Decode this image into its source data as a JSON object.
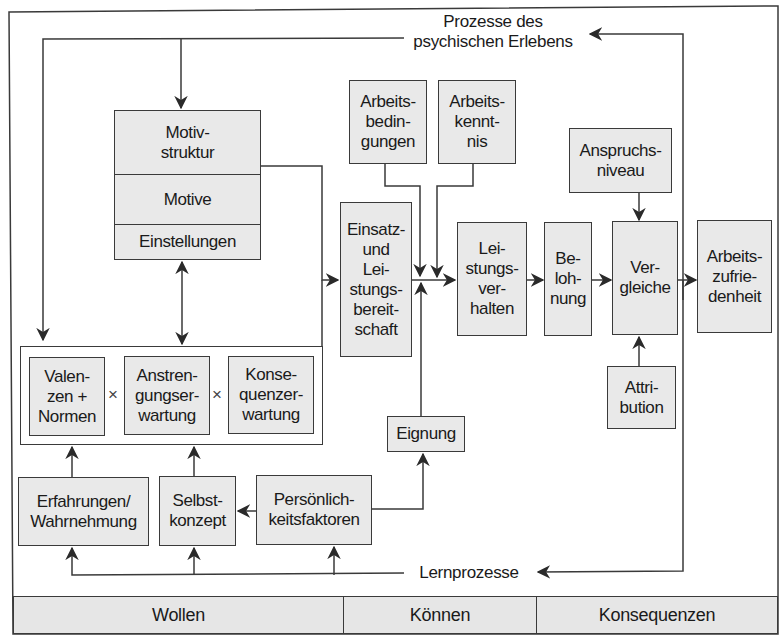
{
  "diagram": {
    "title_top": "Prozesse des\npsychischen Erlebens",
    "title_bottom": "Lernprozesse",
    "nodes": {
      "motivstruktur": "Motiv-\nstruktur",
      "motive": "Motive",
      "einstellungen": "Einstellungen",
      "arbeitsbedingungen": "Arbeits-\nbedin-\ngungen",
      "arbeitskenntnis": "Arbeits-\nkennt-\nnis",
      "einsatzbereitschaft": "Einsatz-\nund\nLei-\nstungs-\nbereit-\nschaft",
      "leistungsverhalten": "Lei-\nstungs-\nver-\nhalten",
      "belohnung": "Be-\nloh-\nnung",
      "anspruchsniveau": "Anspruchs-\nniveau",
      "vergleiche": "Ver-\ngleiche",
      "arbeitszufriedenheit": "Arbeits-\nzufrie-\ndenheit",
      "attribution": "Attri-\nbution",
      "valenzen": "Valen-\nzen +\nNormen",
      "anstrengungserwartung": "Anstren-\ngungser-\nwartung",
      "konsequenzerwartung": "Konse-\nquenzer-\nwartung",
      "eignung": "Eignung",
      "erfahrungen": "Erfahrungen/\nWahrnehmung",
      "selbstkonzept": "Selbst-\nkonzept",
      "persoenlichkeitsfaktoren": "Persönlich-\nkeitsfaktoren"
    },
    "operators": {
      "times_1": "×",
      "times_2": "×"
    },
    "bands": [
      "Wollen",
      "Können",
      "Konsequenzen"
    ],
    "colors": {
      "box_fill": "#e9e9e9",
      "line": "#3a3a3a",
      "background": "#ffffff"
    }
  }
}
